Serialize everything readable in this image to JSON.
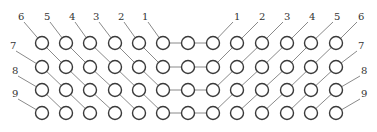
{
  "diagram": {
    "type": "symmetric-chain-lattice",
    "columns_x": [
      42,
      66,
      90,
      115,
      139,
      163,
      188,
      213,
      237,
      262,
      287,
      311,
      336
    ],
    "rows_y": [
      43,
      67,
      90,
      113
    ],
    "node_radius": 6.5,
    "colors": {
      "node_stroke": "#3a3a3a",
      "wire": "#8a8a8a",
      "label": "#333333",
      "background": "#ffffff"
    },
    "left_labels": [
      {
        "text": "1",
        "x": 142,
        "y": 20
      },
      {
        "text": "2",
        "x": 118,
        "y": 20
      },
      {
        "text": "3",
        "x": 93,
        "y": 20
      },
      {
        "text": "4",
        "x": 69,
        "y": 20
      },
      {
        "text": "5",
        "x": 44,
        "y": 20
      },
      {
        "text": "6",
        "x": 18,
        "y": 20
      },
      {
        "text": "7",
        "x": 10,
        "y": 49
      },
      {
        "text": "8",
        "x": 12,
        "y": 74
      },
      {
        "text": "9",
        "x": 12,
        "y": 97
      }
    ],
    "right_labels": [
      {
        "text": "1",
        "x": 234,
        "y": 20
      },
      {
        "text": "2",
        "x": 259,
        "y": 20
      },
      {
        "text": "3",
        "x": 284,
        "y": 20
      },
      {
        "text": "4",
        "x": 309,
        "y": 20
      },
      {
        "text": "5",
        "x": 334,
        "y": 20
      },
      {
        "text": "6",
        "x": 358,
        "y": 20
      },
      {
        "text": "7",
        "x": 358,
        "y": 49
      },
      {
        "text": "8",
        "x": 361,
        "y": 74
      },
      {
        "text": "9",
        "x": 361,
        "y": 97
      }
    ]
  }
}
